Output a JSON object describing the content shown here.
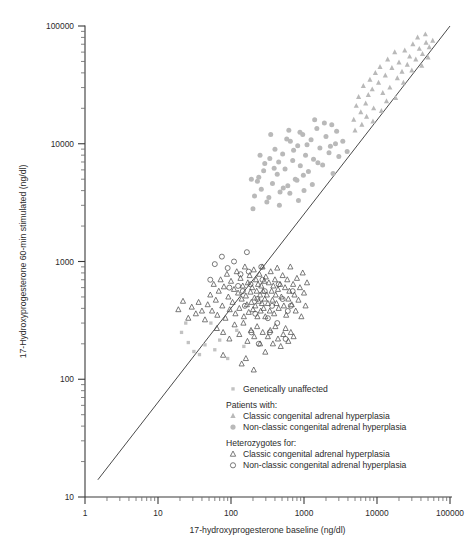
{
  "chart_data": {
    "type": "scatter",
    "title": "",
    "xlabel": "17-hydroxyprogesterone baseline (ng/dl)",
    "ylabel": "17-Hydroxyprogesterone 60-min stimulated (ng/dl)",
    "xscale": "log",
    "yscale": "log",
    "xlim": [
      1,
      100000
    ],
    "ylim": [
      10,
      100000
    ],
    "xticks": [
      1,
      10,
      100,
      1000,
      10000,
      100000
    ],
    "xticklabels": [
      "1",
      "10",
      "100",
      "1000",
      "10000",
      "100000"
    ],
    "yticks": [
      10,
      100,
      1000,
      10000,
      100000
    ],
    "yticklabels": [
      "10",
      "100",
      "1000",
      "10000",
      "100000"
    ],
    "grid": false,
    "minor_ticks": true,
    "reference_line": {
      "name": "identity-line",
      "from": [
        1.5,
        14
      ],
      "to": [
        100000,
        100000
      ],
      "color": "#4a4a4a"
    },
    "legend": {
      "position": "inside-lower-right",
      "entries": [
        {
          "label": "Genetically unaffected",
          "marker": "square",
          "style": "filled",
          "color": "#c2c2c2"
        },
        {
          "group": "Patients with:",
          "label": "Classic congenital adrenal hyperplasia",
          "marker": "triangle",
          "style": "filled",
          "color": "#b9b9b9"
        },
        {
          "group": "Patients with:",
          "label": "Non-classic congenital adrenal hyperplasia",
          "marker": "circle",
          "style": "filled",
          "color": "#b9b9b9"
        },
        {
          "group": "Heterozygotes for:",
          "label": "Classic congenital adrenal hyperplasia",
          "marker": "triangle",
          "style": "open",
          "color": "#4f4f4f"
        },
        {
          "group": "Heterozygotes for:",
          "label": "Non-classic congenital adrenal hyperplasia",
          "marker": "circle",
          "style": "open",
          "color": "#4f4f4f"
        }
      ]
    },
    "series": [
      {
        "name": "Genetically unaffected",
        "marker": "square",
        "style": "filled",
        "color": "#c2c2c2",
        "points": [
          [
            21,
            250
          ],
          [
            24,
            300
          ],
          [
            26,
            205
          ],
          [
            31,
            172
          ],
          [
            37,
            162
          ],
          [
            44,
            196
          ],
          [
            53,
            300
          ],
          [
            60,
            178
          ],
          [
            70,
            215
          ],
          [
            90,
            150
          ],
          [
            120,
            260
          ],
          [
            150,
            190
          ]
        ]
      },
      {
        "name": "Classic congenital adrenal hyperplasia patients",
        "marker": "triangle",
        "style": "filled",
        "color": "#b9b9b9",
        "points": [
          [
            5200,
            21000
          ],
          [
            5600,
            25000
          ],
          [
            6000,
            18500
          ],
          [
            6500,
            31000
          ],
          [
            7000,
            22000
          ],
          [
            7600,
            26000
          ],
          [
            8000,
            35000
          ],
          [
            8600,
            29000
          ],
          [
            9000,
            20000
          ],
          [
            9500,
            40000
          ],
          [
            10500,
            33000
          ],
          [
            11000,
            45000
          ],
          [
            12000,
            27000
          ],
          [
            13000,
            38000
          ],
          [
            14000,
            52000
          ],
          [
            15000,
            30000
          ],
          [
            16000,
            44000
          ],
          [
            17500,
            60000
          ],
          [
            19000,
            36000
          ],
          [
            20000,
            49000
          ],
          [
            22000,
            41000
          ],
          [
            24000,
            62000
          ],
          [
            26000,
            47000
          ],
          [
            28000,
            55000
          ],
          [
            31000,
            70000
          ],
          [
            34000,
            52000
          ],
          [
            38000,
            64000
          ],
          [
            42000,
            58000
          ],
          [
            47000,
            72000
          ],
          [
            52000,
            66000
          ],
          [
            4800,
            16000
          ],
          [
            5000,
            13000
          ],
          [
            6200,
            14500
          ],
          [
            7200,
            17000
          ],
          [
            8800,
            15500
          ],
          [
            11500,
            19000
          ],
          [
            13500,
            23000
          ],
          [
            18000,
            24500
          ],
          [
            23000,
            33000
          ],
          [
            30000,
            42000
          ],
          [
            36000,
            80000
          ],
          [
            41000,
            46000
          ],
          [
            46000,
            85000
          ],
          [
            50000,
            54000
          ],
          [
            58000,
            75000
          ]
        ]
      },
      {
        "name": "Non-classic congenital adrenal hyperplasia patients",
        "marker": "circle",
        "style": "filled",
        "color": "#b9b9b9",
        "points": [
          [
            210,
            3600
          ],
          [
            240,
            5200
          ],
          [
            260,
            4100
          ],
          [
            290,
            6800
          ],
          [
            310,
            3200
          ],
          [
            340,
            7500
          ],
          [
            370,
            4600
          ],
          [
            400,
            9000
          ],
          [
            430,
            5500
          ],
          [
            470,
            3900
          ],
          [
            510,
            8200
          ],
          [
            550,
            6100
          ],
          [
            600,
            4400
          ],
          [
            650,
            10500
          ],
          [
            700,
            7200
          ],
          [
            760,
            5000
          ],
          [
            820,
            9600
          ],
          [
            890,
            6500
          ],
          [
            960,
            12000
          ],
          [
            1050,
            8000
          ],
          [
            1150,
            5800
          ],
          [
            1250,
            10800
          ],
          [
            1350,
            7400
          ],
          [
            1500,
            13500
          ],
          [
            1650,
            9200
          ],
          [
            1800,
            6600
          ],
          [
            2000,
            11500
          ],
          [
            2200,
            8400
          ],
          [
            2400,
            14500
          ],
          [
            2700,
            10000
          ],
          [
            3000,
            7800
          ],
          [
            200,
            2800
          ],
          [
            230,
            4800
          ],
          [
            280,
            5900
          ],
          [
            330,
            3500
          ],
          [
            390,
            6200
          ],
          [
            450,
            7000
          ],
          [
            520,
            4200
          ],
          [
            580,
            11000
          ],
          [
            640,
            3800
          ],
          [
            720,
            8800
          ],
          [
            800,
            4900
          ],
          [
            880,
            12500
          ],
          [
            980,
            5400
          ],
          [
            1100,
            9800
          ],
          [
            1300,
            4500
          ],
          [
            1550,
            6900
          ],
          [
            1900,
            15000
          ],
          [
            2300,
            9500
          ],
          [
            2800,
            12800
          ],
          [
            3400,
            10500
          ],
          [
            3900,
            8600
          ],
          [
            190,
            5000
          ],
          [
            250,
            8000
          ],
          [
            350,
            12000
          ],
          [
            460,
            3000
          ],
          [
            620,
            13000
          ],
          [
            840,
            3300
          ],
          [
            1000,
            4000
          ],
          [
            1400,
            16000
          ],
          [
            2500,
            5600
          ]
        ]
      },
      {
        "name": "Heterozygotes for classic congenital adrenal hyperplasia",
        "marker": "triangle",
        "style": "open",
        "color": "#4f4f4f",
        "points": [
          [
            48,
            430
          ],
          [
            52,
            520
          ],
          [
            55,
            380
          ],
          [
            58,
            640
          ],
          [
            62,
            470
          ],
          [
            65,
            350
          ],
          [
            68,
            560
          ],
          [
            72,
            700
          ],
          [
            76,
            420
          ],
          [
            80,
            610
          ],
          [
            84,
            330
          ],
          [
            88,
            780
          ],
          [
            92,
            500
          ],
          [
            96,
            390
          ],
          [
            100,
            680
          ],
          [
            105,
            450
          ],
          [
            110,
            580
          ],
          [
            115,
            360
          ],
          [
            120,
            820
          ],
          [
            125,
            540
          ],
          [
            130,
            400
          ],
          [
            135,
            720
          ],
          [
            140,
            480
          ],
          [
            145,
            620
          ],
          [
            150,
            340
          ],
          [
            155,
            900
          ],
          [
            160,
            510
          ],
          [
            165,
            430
          ],
          [
            170,
            660
          ],
          [
            175,
            370
          ],
          [
            180,
            760
          ],
          [
            185,
            550
          ],
          [
            190,
            450
          ],
          [
            195,
            600
          ],
          [
            200,
            390
          ],
          [
            205,
            850
          ],
          [
            210,
            490
          ],
          [
            215,
            420
          ],
          [
            220,
            700
          ],
          [
            225,
            560
          ],
          [
            230,
            340
          ],
          [
            235,
            640
          ],
          [
            240,
            460
          ],
          [
            245,
            780
          ],
          [
            250,
            520
          ],
          [
            255,
            380
          ],
          [
            260,
            620
          ],
          [
            265,
            440
          ],
          [
            270,
            900
          ],
          [
            275,
            560
          ],
          [
            280,
            400
          ],
          [
            285,
            680
          ],
          [
            290,
            480
          ],
          [
            295,
            340
          ],
          [
            300,
            740
          ],
          [
            310,
            520
          ],
          [
            320,
            440
          ],
          [
            330,
            660
          ],
          [
            340,
            380
          ],
          [
            350,
            820
          ],
          [
            360,
            560
          ],
          [
            370,
            470
          ],
          [
            380,
            620
          ],
          [
            390,
            360
          ],
          [
            400,
            700
          ],
          [
            410,
            520
          ],
          [
            420,
            440
          ],
          [
            430,
            880
          ],
          [
            440,
            580
          ],
          [
            450,
            400
          ],
          [
            470,
            640
          ],
          [
            490,
            500
          ],
          [
            510,
            760
          ],
          [
            530,
            420
          ],
          [
            550,
            600
          ],
          [
            570,
            350
          ],
          [
            590,
            700
          ],
          [
            610,
            480
          ],
          [
            630,
            560
          ],
          [
            650,
            900
          ],
          [
            680,
            430
          ],
          [
            710,
            640
          ],
          [
            740,
            520
          ],
          [
            770,
            380
          ],
          [
            800,
            720
          ],
          [
            840,
            470
          ],
          [
            880,
            600
          ],
          [
            920,
            340
          ],
          [
            960,
            800
          ],
          [
            1000,
            540
          ],
          [
            1050,
            420
          ],
          [
            1100,
            660
          ],
          [
            64,
            270
          ],
          [
            78,
            250
          ],
          [
            95,
            220
          ],
          [
            112,
            290
          ],
          [
            130,
            240
          ],
          [
            148,
            300
          ],
          [
            168,
            210
          ],
          [
            188,
            260
          ],
          [
            208,
            230
          ],
          [
            228,
            280
          ],
          [
            250,
            200
          ],
          [
            272,
            250
          ],
          [
            295,
            170
          ],
          [
            320,
            230
          ],
          [
            345,
            260
          ],
          [
            375,
            200
          ],
          [
            405,
            280
          ],
          [
            440,
            220
          ],
          [
            480,
            190
          ],
          [
            520,
            240
          ],
          [
            560,
            270
          ],
          [
            610,
            210
          ],
          [
            660,
            250
          ],
          [
            720,
            230
          ],
          [
            40,
            380
          ],
          [
            44,
            320
          ],
          [
            36,
            450
          ],
          [
            33,
            360
          ],
          [
            29,
            410
          ],
          [
            26,
            330
          ],
          [
            22,
            460
          ],
          [
            19,
            390
          ],
          [
            160,
            150
          ],
          [
            140,
            135
          ],
          [
            205,
            120
          ],
          [
            78,
            160
          ]
        ]
      },
      {
        "name": "Heterozygotes for non-classic congenital adrenal hyperplasia",
        "marker": "circle",
        "style": "open",
        "color": "#4f4f4f",
        "points": [
          [
            60,
            950
          ],
          [
            75,
            1100
          ],
          [
            90,
            880
          ],
          [
            110,
            1000
          ],
          [
            135,
            780
          ],
          [
            165,
            1200
          ],
          [
            52,
            700
          ],
          [
            145,
            560
          ],
          [
            185,
            640
          ],
          [
            230,
            480
          ],
          [
            270,
            700
          ],
          [
            320,
            330
          ],
          [
            190,
            250
          ],
          [
            240,
            200
          ],
          [
            155,
            420
          ],
          [
            215,
            360
          ],
          [
            290,
            560
          ],
          [
            365,
            420
          ],
          [
            430,
            300
          ],
          [
            510,
            480
          ],
          [
            600,
            380
          ],
          [
            700,
            560
          ],
          [
            125,
            620
          ],
          [
            175,
            820
          ],
          [
            95,
            600
          ],
          [
            260,
            900
          ],
          [
            340,
            250
          ],
          [
            450,
            640
          ],
          [
            560,
            220
          ],
          [
            660,
            420
          ]
        ]
      }
    ]
  }
}
